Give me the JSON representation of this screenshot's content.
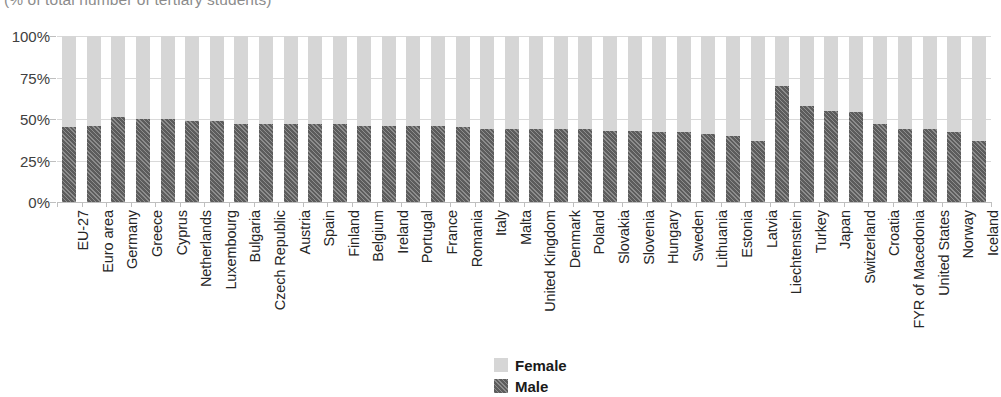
{
  "chart_data": {
    "type": "bar",
    "subtype": "stacked-percent",
    "title": "(% of total number of tertiary students)",
    "xlabel": "",
    "ylabel": "",
    "ylim": [
      0,
      100
    ],
    "ytick_labels": [
      "0%",
      "25%",
      "50%",
      "75%",
      "100%"
    ],
    "ytick_values": [
      0,
      25,
      50,
      75,
      100
    ],
    "grid": true,
    "legend_position": "bottom-center",
    "categories": [
      "EU-27",
      "Euro area",
      "Germany",
      "Greece",
      "Cyprus",
      "Netherlands",
      "Luxembourg",
      "Bulgaria",
      "Czech Republic",
      "Austria",
      "Spain",
      "Finland",
      "Belgium",
      "Ireland",
      "Portugal",
      "France",
      "Romania",
      "Italy",
      "Malta",
      "United Kingdom",
      "Denmark",
      "Poland",
      "Slovakia",
      "Slovenia",
      "Hungary",
      "Sweden",
      "Lithuania",
      "Estonia",
      "Latvia",
      "Liechtenstein",
      "Turkey",
      "Japan",
      "Switzerland",
      "Croatia",
      "FYR of Macedonia",
      "United States",
      "Norway",
      "Iceland"
    ],
    "series": [
      {
        "name": "Male",
        "color": "#5c5c5c",
        "pattern": "diagonal-hatch",
        "values": [
          45,
          46,
          51,
          50,
          50,
          49,
          49,
          47,
          47,
          47,
          47,
          47,
          46,
          46,
          46,
          46,
          45,
          44,
          44,
          44,
          44,
          44,
          43,
          43,
          42,
          42,
          41,
          40,
          37,
          70,
          58,
          55,
          54,
          47,
          44,
          44,
          42,
          37
        ]
      },
      {
        "name": "Female",
        "color": "#d6d6d6",
        "pattern": "solid",
        "values": [
          55,
          54,
          49,
          50,
          50,
          51,
          51,
          53,
          53,
          53,
          53,
          53,
          54,
          54,
          54,
          54,
          55,
          56,
          56,
          56,
          56,
          56,
          57,
          57,
          58,
          58,
          59,
          60,
          63,
          30,
          42,
          45,
          46,
          53,
          56,
          56,
          58,
          63
        ]
      }
    ]
  },
  "legend": {
    "items": [
      {
        "label": "Female",
        "key": "female"
      },
      {
        "label": "Male",
        "key": "male"
      }
    ]
  }
}
